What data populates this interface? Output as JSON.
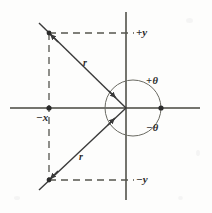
{
  "figure": {
    "background_color": "#fdfdfc",
    "ink_color": "#3a3a3a",
    "axes": {
      "origin": {
        "x": 126,
        "y": 108
      },
      "vertical": {
        "x": 126,
        "y_top": 12,
        "y_bottom": 200
      },
      "horizontal": {
        "y": 108,
        "x_left": 10,
        "x_right": 200
      },
      "labels": {
        "positive_y": "+y",
        "negative_y": "−y",
        "negative_x": "−x"
      }
    },
    "angle_circle": {
      "center": {
        "x": 133,
        "y": 108
      },
      "radius": 28,
      "positive_label": "+θ",
      "negative_label": "−θ"
    },
    "rays": [
      {
        "name": "upper-left-ray",
        "label": "r",
        "from": {
          "x": 126,
          "y": 108
        },
        "to": {
          "x": 49,
          "y": 33
        },
        "label_pos": {
          "x": 83,
          "y": 58
        },
        "arrow_toward_origin": true
      },
      {
        "name": "lower-left-ray",
        "label": "r",
        "from": {
          "x": 126,
          "y": 108
        },
        "to": {
          "x": 49,
          "y": 180
        },
        "label_pos": {
          "x": 79,
          "y": 152
        },
        "arrow_toward_origin": true
      }
    ],
    "dashed_construction": [
      {
        "name": "upper-horizontal",
        "x1": 49,
        "y1": 33,
        "x2": 134,
        "y2": 33
      },
      {
        "name": "lower-horizontal",
        "x1": 49,
        "y1": 180,
        "x2": 134,
        "y2": 180
      },
      {
        "name": "left-vertical",
        "x1": 49,
        "y1": 33,
        "x2": 49,
        "y2": 180
      }
    ],
    "point_markers": [
      {
        "name": "upper-endpoint",
        "x": 49,
        "y": 33
      },
      {
        "name": "lower-endpoint",
        "x": 49,
        "y": 180
      },
      {
        "name": "negative-x-point",
        "x": 49,
        "y": 108
      },
      {
        "name": "circle-right-point",
        "x": 161,
        "y": 108
      }
    ]
  }
}
